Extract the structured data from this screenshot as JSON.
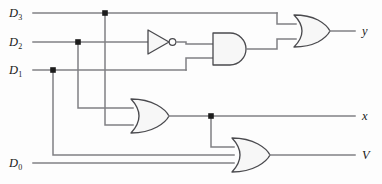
{
  "figure": {
    "kind": "logic-circuit-diagram",
    "width": 382,
    "height": 184,
    "background_color": "#fdfdfd",
    "wire_color": "#808084",
    "gate_outline_color": "#4a4a4e",
    "gate_fill_color": "#f7f7f7",
    "junction_color": "#1c1c1c"
  },
  "inputs": [
    {
      "id": "d3",
      "base": "D",
      "sub": "3",
      "label": "D3",
      "y": 13
    },
    {
      "id": "d2",
      "base": "D",
      "sub": "2",
      "label": "D2",
      "y": 42
    },
    {
      "id": "d1",
      "base": "D",
      "sub": "1",
      "label": "D1",
      "y": 70
    },
    {
      "id": "d0",
      "base": "D",
      "sub": "0",
      "label": "D0",
      "y": 163
    }
  ],
  "outputs": [
    {
      "id": "y",
      "label": "y",
      "y": 31
    },
    {
      "id": "x",
      "label": "x",
      "y": 116
    },
    {
      "id": "v",
      "label": "V",
      "y": 155
    }
  ],
  "gates": [
    {
      "id": "not1",
      "type": "NOT",
      "label": "NOT",
      "inputs": 1,
      "output": "not-d2"
    },
    {
      "id": "and1",
      "type": "AND",
      "label": "AND",
      "inputs": 2,
      "output": "and-out"
    },
    {
      "id": "or-top",
      "type": "OR",
      "label": "OR",
      "inputs": 2,
      "output": "y"
    },
    {
      "id": "or-mid",
      "type": "OR",
      "label": "OR",
      "inputs": 2,
      "output": "x"
    },
    {
      "id": "or-bot",
      "type": "OR",
      "label": "OR",
      "inputs": 3,
      "output": "V"
    }
  ],
  "junctions": [
    {
      "id": "j-d3",
      "x": 105,
      "y": 13,
      "on": "D3"
    },
    {
      "id": "j-d2",
      "x": 78,
      "y": 42,
      "on": "D2"
    },
    {
      "id": "j-d1",
      "x": 53,
      "y": 70,
      "on": "D1"
    },
    {
      "id": "j-x",
      "x": 211,
      "y": 116,
      "on": "x"
    }
  ]
}
